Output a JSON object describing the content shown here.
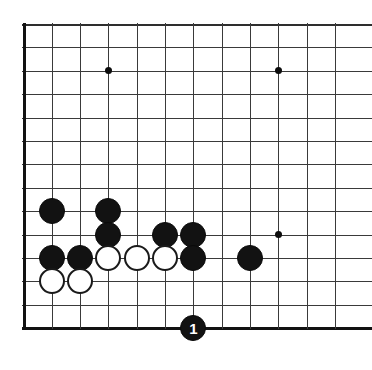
{
  "figure": {
    "kind": "go-board-diagram",
    "width": 372,
    "height": 370,
    "background_color": "#ffffff"
  },
  "board": {
    "origin_x": 23.5,
    "origin_y": 24,
    "col_spacing": 28.3,
    "row_spacing": 23.4,
    "cols_visible": 12,
    "rows_visible": 14,
    "line_color": "#3a3a3a",
    "edge_color": "#121212",
    "edges": {
      "left": true,
      "top": true,
      "bottom": true,
      "right": false
    },
    "star_points": [
      {
        "col": 3,
        "row": 2,
        "name": "star-point-upper-left"
      },
      {
        "col": 9,
        "row": 2,
        "name": "star-point-upper-right"
      },
      {
        "col": 9,
        "row": 9,
        "name": "star-point-lower-right"
      }
    ]
  },
  "stones": {
    "black_color": "#121212",
    "white_color": "#ffffff",
    "radius": 13,
    "items": [
      {
        "col": 1,
        "row": 8,
        "color": "black",
        "label": ""
      },
      {
        "col": 3,
        "row": 8,
        "color": "black",
        "label": ""
      },
      {
        "col": 3,
        "row": 9,
        "color": "black",
        "label": ""
      },
      {
        "col": 5,
        "row": 9,
        "color": "black",
        "label": ""
      },
      {
        "col": 6,
        "row": 9,
        "color": "black",
        "label": ""
      },
      {
        "col": 1,
        "row": 10,
        "color": "black",
        "label": ""
      },
      {
        "col": 2,
        "row": 10,
        "color": "black",
        "label": ""
      },
      {
        "col": 3,
        "row": 10,
        "color": "white",
        "label": ""
      },
      {
        "col": 4,
        "row": 10,
        "color": "white",
        "label": ""
      },
      {
        "col": 5,
        "row": 10,
        "color": "white",
        "label": ""
      },
      {
        "col": 6,
        "row": 10,
        "color": "black",
        "label": ""
      },
      {
        "col": 8,
        "row": 10,
        "color": "black",
        "label": ""
      },
      {
        "col": 1,
        "row": 11,
        "color": "white",
        "label": ""
      },
      {
        "col": 2,
        "row": 11,
        "color": "white",
        "label": ""
      },
      {
        "col": 6,
        "row": 13,
        "color": "black",
        "label": "1"
      }
    ]
  },
  "move_markers": [
    {
      "number": "1",
      "color": "black",
      "col": 6,
      "row": 13
    }
  ]
}
